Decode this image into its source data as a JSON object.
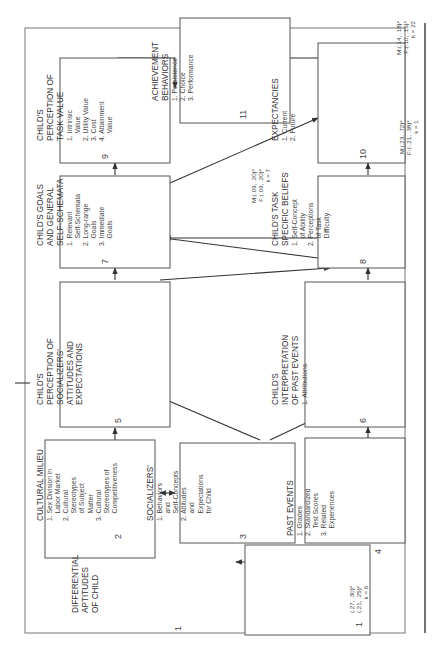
{
  "figure": {
    "boxes": [
      {
        "id": 1,
        "number": "1",
        "title_lines": [
          "DIFFERENTIAL",
          "APTITUDES",
          "OF CHILD"
        ],
        "items": []
      },
      {
        "id": 2,
        "number": "2",
        "title_lines": [
          "CULTURAL MILIEU"
        ],
        "items": [
          "1. Sex Division in",
          "    Labor Market",
          "2. Cultural",
          "    Stereotypes",
          "    of Subject",
          "    Matter",
          "3. Cultural",
          "    Stereotypes of",
          "    Competitiveness"
        ]
      },
      {
        "id": 3,
        "number": "3",
        "title_lines": [
          "SOCIALIZERS'"
        ],
        "items": [
          "1. Behaviors",
          "    and",
          "    Self-Concepts",
          "2. Attitudes",
          "    and",
          "    Expectations",
          "    for Child"
        ]
      },
      {
        "id": 4,
        "number": "4",
        "title_lines": [
          "PAST EVENTS"
        ],
        "items": [
          "1. Grades",
          "2. Standardized",
          "    Test Scores",
          "3. Related",
          "    Experiences"
        ]
      },
      {
        "id": 5,
        "number": "5",
        "title_lines": [
          "CHILD'S",
          "PERCEPTION OF",
          "SOCIALIZERS'",
          "ATTITUDES AND",
          "EXPECTATIONS"
        ],
        "items": []
      },
      {
        "id": 6,
        "number": "6",
        "title_lines": [
          "CHILD'S",
          "INTERPRETATION",
          "OF PAST EVENTS"
        ],
        "items": [
          "1. Attributions"
        ]
      },
      {
        "id": 7,
        "number": "7",
        "title_lines": [
          "CHILD'S GOALS",
          "AND GENERAL",
          "SELF-SCHEMATA"
        ],
        "items": [
          "1. Relevant",
          "    Self-Schemata",
          "2. Long-range",
          "    Goals",
          "3. Immediate",
          "    Goals"
        ]
      },
      {
        "id": 8,
        "number": "8",
        "title_lines": [
          "CHILD'S TASK",
          "SPECIFIC BELIEFS"
        ],
        "items": [
          "1. Self-Concept",
          "    of Ability",
          "2. Perceptions",
          "    of Task",
          "    Difficulty"
        ]
      },
      {
        "id": 9,
        "number": "9",
        "title_lines": [
          "CHILD'S",
          "PERCEPTION OF",
          "TASK VALUE"
        ],
        "items": [
          "1. Intrinsic",
          "    Value",
          "2. Utility Value",
          "3. Cost",
          "4. Attainment",
          "    Value"
        ]
      },
      {
        "id": 10,
        "number": "10",
        "title_lines": [
          "EXPECTANCIES"
        ],
        "items": [
          "1. Current",
          "2. Future"
        ]
      },
      {
        "id": 11,
        "number": "11",
        "title_lines": [
          "ACHIEVEMENT",
          "BEHAVIORS"
        ],
        "items": [
          "1. Persistence",
          "2. Choice",
          "3. Performance"
        ]
      }
    ],
    "path_stats": [
      {
        "id": "aptitudes_to_past_events",
        "lines": [
          "(.27, .30)*",
          "(.21, .25)*",
          "k = 6"
        ]
      },
      {
        "id": "task_beliefs_to_task_value",
        "lines": [
          "M:(.09, .20)*",
          "F:(.09, .20)*",
          "k = 7"
        ]
      },
      {
        "id": "task_beliefs_to_expectancies",
        "lines": [
          "M:(.23, .72)*",
          "F:(-.21, .38)*",
          "k = 1"
        ]
      },
      {
        "id": "task_value_to_achievement",
        "lines": [
          "M:(.14, .18)*",
          "F:(.10, .15)*",
          "k = 22"
        ]
      }
    ]
  }
}
